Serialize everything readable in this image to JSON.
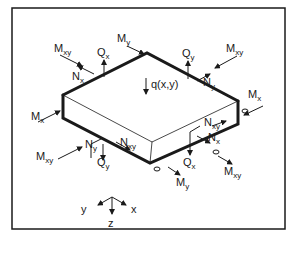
{
  "figure": {
    "load_label": "q(x,y)",
    "axes": {
      "x": "x",
      "y": "y",
      "z": "z"
    },
    "labels": {
      "top_left_Mxy": {
        "main": "M",
        "sub": "xy"
      },
      "top_left_Nx": {
        "main": "N",
        "sub": "x"
      },
      "top_Qx": {
        "main": "Q",
        "sub": "x"
      },
      "top_My": {
        "main": "M",
        "sub": "y"
      },
      "top_Qy": {
        "main": "Q",
        "sub": "y"
      },
      "top_right_Mxy": {
        "main": "M",
        "sub": "xy"
      },
      "top_right_Ny": {
        "main": "N",
        "sub": "y"
      },
      "right_Mx": {
        "main": "M",
        "sub": "x"
      },
      "left_Mx": {
        "main": "M",
        "sub": "x"
      },
      "right_Nxy": {
        "main": "N",
        "sub": "xy"
      },
      "bottom_right_Nx": {
        "main": "N",
        "sub": "x"
      },
      "bottom_Qx": {
        "main": "Q",
        "sub": "x"
      },
      "bottom_right_Mxy": {
        "main": "M",
        "sub": "xy"
      },
      "bottom_My": {
        "main": "M",
        "sub": "y"
      },
      "front_Nxy": {
        "main": "N",
        "sub": "xy"
      },
      "bottom_left_Ny": {
        "main": "N",
        "sub": "y"
      },
      "bottom_left_Qy": {
        "main": "Q",
        "sub": "y"
      },
      "bottom_left_Mxy": {
        "main": "M",
        "sub": "xy"
      }
    }
  },
  "colors": {
    "ink": "#1a1a1a",
    "background": "#ffffff"
  }
}
